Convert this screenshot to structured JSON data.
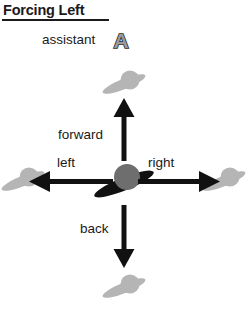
{
  "header": {
    "title": "Forcing Left",
    "assistant_label": "assistant",
    "assistant_badge_letter": "A"
  },
  "diagram": {
    "name": "direction-cross",
    "labels": {
      "forward": "forward",
      "left": "left",
      "right": "right",
      "back": "back"
    },
    "arrows": [
      {
        "direction": "up",
        "label": "forward"
      },
      {
        "direction": "down",
        "label": "back"
      },
      {
        "direction": "left",
        "label": "left"
      },
      {
        "direction": "right",
        "label": "right"
      }
    ],
    "center_agent": {
      "name": "bird-icon-center",
      "state": "active"
    },
    "outer_agents": [
      {
        "name": "bird-icon-top",
        "position": "top"
      },
      {
        "name": "bird-icon-bottom",
        "position": "bottom"
      },
      {
        "name": "bird-icon-left",
        "position": "left"
      },
      {
        "name": "bird-icon-right",
        "position": "right"
      }
    ]
  },
  "colors": {
    "background": "#ffffff",
    "text": "#1a1a1a",
    "arrow": "#111111",
    "bird_center_wing": "#111111",
    "bird_center_body": "#6e6e6e",
    "bird_outer": "#b5b5b5",
    "badge_fill": "#9a9a9a",
    "badge_stroke": "#2b2b2b"
  }
}
